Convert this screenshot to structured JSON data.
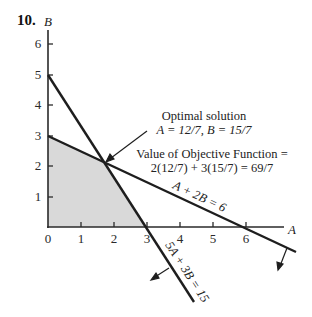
{
  "problem": {
    "number": "10."
  },
  "axes": {
    "x_label": "A",
    "y_label": "B",
    "x_ticks": [
      "0",
      "1",
      "2",
      "3",
      "4",
      "5",
      "6"
    ],
    "y_ticks": [
      "1",
      "2",
      "3",
      "4",
      "5",
      "6"
    ]
  },
  "annotations": {
    "optimal_title": "Optimal solution",
    "optimal_values": "A = 12/7, B = 15/7",
    "objective_line1": "Value of Objective Function =",
    "objective_line2": "2(12/7) + 3(15/7) = 69/7"
  },
  "constraints": [
    {
      "label": "A + 2B = 6",
      "a_intercept": 6,
      "b_intercept": 3
    },
    {
      "label": "5A + 3B = 15",
      "a_intercept": 3,
      "b_intercept": 5
    }
  ],
  "feasible_region": {
    "vertices": [
      [
        0,
        0
      ],
      [
        0,
        3
      ],
      [
        1.714,
        2.143
      ],
      [
        3,
        0
      ]
    ],
    "fill": "#d9d9d9"
  },
  "optimal_point": {
    "A": "12/7",
    "B": "15/7",
    "value": "69/7"
  },
  "colors": {
    "line": "#1e1e1e",
    "region": "#d9d9d9"
  }
}
